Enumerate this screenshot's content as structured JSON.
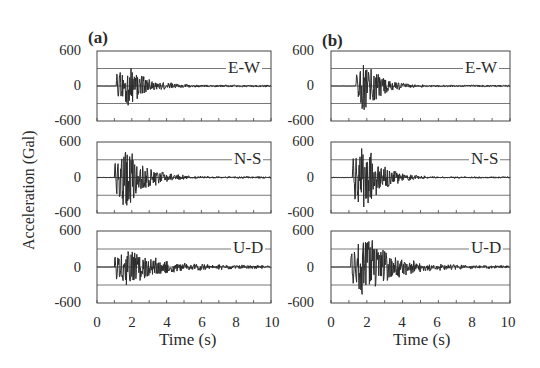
{
  "figure": {
    "ylabel": "Acceleration (Gal)",
    "xlabel": "Time (s)",
    "panels": [
      {
        "letter": "(a)"
      },
      {
        "letter": "(b)"
      }
    ],
    "components": [
      "E-W",
      "N-S",
      "U-D"
    ],
    "yticks": [
      "600",
      "0",
      "-600"
    ],
    "xticks": [
      "0",
      "2",
      "4",
      "6",
      "8",
      "10"
    ]
  },
  "colors": {
    "trace": "#2b2b2b",
    "grid": "#555555",
    "frame": "#444444",
    "background": "#ffffff"
  },
  "chart_data": [
    {
      "type": "line",
      "title": "(a) E-W",
      "xlabel": "Time (s)",
      "ylabel": "Acceleration (Gal)",
      "xlim": [
        0,
        10
      ],
      "ylim": [
        -600,
        600
      ],
      "yticks": [
        -600,
        0,
        600
      ],
      "xticks": [
        0,
        2,
        4,
        6,
        8,
        10
      ],
      "grid": true,
      "gridlines_y": [
        -300,
        0,
        300
      ],
      "series": [
        {
          "name": "E-W",
          "onset_s": 1.1,
          "peak_positive_gal": 380,
          "peak_negative_gal": -330,
          "peak_time_s": 1.8,
          "decay_s": 2.5,
          "residual_amp_gal": 25
        }
      ]
    },
    {
      "type": "line",
      "title": "(a) N-S",
      "xlabel": "Time (s)",
      "ylabel": "Acceleration (Gal)",
      "xlim": [
        0,
        10
      ],
      "ylim": [
        -600,
        600
      ],
      "yticks": [
        -600,
        0,
        600
      ],
      "xticks": [
        0,
        2,
        4,
        6,
        8,
        10
      ],
      "grid": true,
      "gridlines_y": [
        -300,
        0,
        300
      ],
      "series": [
        {
          "name": "N-S",
          "onset_s": 1.0,
          "peak_positive_gal": 560,
          "peak_negative_gal": -470,
          "peak_time_s": 1.7,
          "decay_s": 2.5,
          "residual_amp_gal": 25
        }
      ]
    },
    {
      "type": "line",
      "title": "(a) U-D",
      "xlabel": "Time (s)",
      "ylabel": "Acceleration (Gal)",
      "xlim": [
        0,
        10
      ],
      "ylim": [
        -600,
        600
      ],
      "yticks": [
        -600,
        0,
        600
      ],
      "xticks": [
        0,
        2,
        4,
        6,
        8,
        10
      ],
      "grid": true,
      "gridlines_y": [
        -300,
        0,
        300
      ],
      "series": [
        {
          "name": "U-D",
          "onset_s": 1.0,
          "peak_positive_gal": 330,
          "peak_negative_gal": -300,
          "peak_time_s": 1.9,
          "decay_s": 4.0,
          "residual_amp_gal": 40
        }
      ]
    },
    {
      "type": "line",
      "title": "(b) E-W",
      "xlabel": "Time (s)",
      "ylabel": "Acceleration (Gal)",
      "xlim": [
        0,
        10
      ],
      "ylim": [
        -600,
        600
      ],
      "yticks": [
        -600,
        0,
        600
      ],
      "xticks": [
        0,
        2,
        4,
        6,
        8,
        10
      ],
      "grid": true,
      "gridlines_y": [
        -300,
        0,
        300
      ],
      "series": [
        {
          "name": "E-W",
          "onset_s": 1.4,
          "peak_positive_gal": 440,
          "peak_negative_gal": -480,
          "peak_time_s": 1.9,
          "decay_s": 2.0,
          "residual_amp_gal": 25
        }
      ]
    },
    {
      "type": "line",
      "title": "(b) N-S",
      "xlabel": "Time (s)",
      "ylabel": "Acceleration (Gal)",
      "xlim": [
        0,
        10
      ],
      "ylim": [
        -600,
        600
      ],
      "yticks": [
        -600,
        0,
        600
      ],
      "xticks": [
        0,
        2,
        4,
        6,
        8,
        10
      ],
      "grid": true,
      "gridlines_y": [
        -300,
        0,
        300
      ],
      "series": [
        {
          "name": "N-S",
          "onset_s": 1.2,
          "peak_positive_gal": 600,
          "peak_negative_gal": -600,
          "peak_time_s": 1.9,
          "decay_s": 2.2,
          "residual_amp_gal": 20
        }
      ]
    },
    {
      "type": "line",
      "title": "(b) U-D",
      "xlabel": "Time (s)",
      "ylabel": "Acceleration (Gal)",
      "xlim": [
        0,
        10
      ],
      "ylim": [
        -600,
        600
      ],
      "yticks": [
        -600,
        0,
        600
      ],
      "xticks": [
        0,
        2,
        4,
        6,
        8,
        10
      ],
      "grid": true,
      "gridlines_y": [
        -300,
        0,
        300
      ],
      "series": [
        {
          "name": "U-D",
          "onset_s": 1.1,
          "peak_positive_gal": 530,
          "peak_negative_gal": -460,
          "peak_time_s": 2.0,
          "decay_s": 3.5,
          "residual_amp_gal": 35
        }
      ]
    }
  ]
}
